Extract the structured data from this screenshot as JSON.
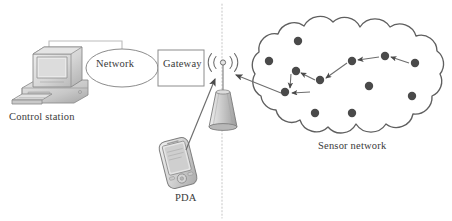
{
  "figure": {
    "kind": "network-architecture-diagram",
    "background_color": "#ffffff",
    "width": 452,
    "height": 221
  },
  "labels": {
    "control_station": "Control station",
    "network": "Network",
    "gateway": "Gateway",
    "pda": "PDA",
    "sensor_network": "Sensor network"
  },
  "colors": {
    "stroke": "#555555",
    "node_fill": "#4a4a4a",
    "text": "#3a3a3a",
    "light_line": "#b9b9b9",
    "divider": "#cfcfcf",
    "device_fill": "#d8d8d8",
    "device_shade": "#b5b5b5",
    "device_highlight": "#ececec"
  },
  "nodes": {
    "control_station": {
      "x": 48,
      "y": 82,
      "icon": "desktop-computer-icon"
    },
    "network_cloud_ellipse": {
      "cx": 122,
      "cy": 68,
      "rx": 36,
      "ry": 19
    },
    "gateway_box": {
      "x": 158,
      "y": 50,
      "width": 46,
      "height": 36
    },
    "base_station": {
      "x": 223,
      "y": 62,
      "icon": "antenna-tower-icon"
    },
    "pda": {
      "x": 178,
      "y": 160,
      "icon": "pda-handheld-icon"
    }
  },
  "divider": {
    "x": 222,
    "y1": 4,
    "y2": 218,
    "style": "dotted"
  },
  "connections": [
    {
      "from": "control-station",
      "to": "network",
      "style": "elbow-line",
      "arrow": false
    },
    {
      "from": "network",
      "to": "gateway",
      "style": "straight-line",
      "arrow": false
    },
    {
      "from": "pda",
      "to": "base-station",
      "style": "arrow",
      "arrow": true
    },
    {
      "from": "base-station",
      "to": "sensor-node-entry",
      "style": "double-arrow",
      "arrow": true
    }
  ],
  "sensor_nodes": [
    {
      "id": "n1",
      "cx": 298,
      "cy": 41
    },
    {
      "id": "n2",
      "cx": 269,
      "cy": 61
    },
    {
      "id": "n3",
      "cx": 296,
      "cy": 71
    },
    {
      "id": "n4",
      "cx": 320,
      "cy": 80
    },
    {
      "id": "n5",
      "cx": 285,
      "cy": 92
    },
    {
      "id": "n6",
      "cx": 352,
      "cy": 61
    },
    {
      "id": "n7",
      "cx": 385,
      "cy": 56
    },
    {
      "id": "n8",
      "cx": 415,
      "cy": 63
    },
    {
      "id": "n9",
      "cx": 369,
      "cy": 86
    },
    {
      "id": "n10",
      "cx": 412,
      "cy": 96
    },
    {
      "id": "n11",
      "cx": 315,
      "cy": 113
    },
    {
      "id": "n12",
      "cx": 352,
      "cy": 113
    }
  ],
  "routing_path": {
    "description": "multi-hop route from far sensor node to base station",
    "hops": [
      {
        "cx": 415,
        "cy": 63
      },
      {
        "cx": 385,
        "cy": 56
      },
      {
        "cx": 352,
        "cy": 61
      },
      {
        "cx": 320,
        "cy": 80
      },
      {
        "cx": 296,
        "cy": 71
      },
      {
        "cx": 285,
        "cy": 92
      }
    ],
    "direction": "right-to-left"
  },
  "cloud": {
    "label": "sensor-network-cloud",
    "bounds": {
      "x": 254,
      "y": 22,
      "width": 192,
      "height": 110
    }
  },
  "radio_waves": {
    "count": 4,
    "origin": {
      "x": 223,
      "y": 63
    },
    "description": "concentric radio emission arcs on both sides of antenna tip"
  }
}
